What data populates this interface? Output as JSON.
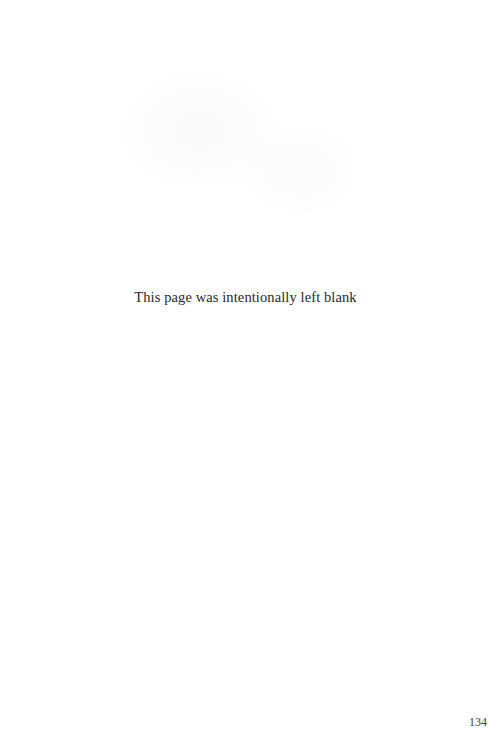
{
  "page": {
    "notice": "This page was intentionally left blank",
    "page_number": "134"
  }
}
